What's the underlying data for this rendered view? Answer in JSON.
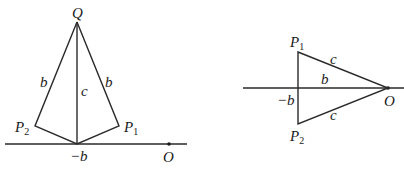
{
  "diagrams": [
    {
      "name": "left-figure",
      "labels": {
        "Q": "Q",
        "P1": "P",
        "P1_sub": "1",
        "P2": "P",
        "P2_sub": "2",
        "side_left": "b",
        "side_right": "b",
        "vertical": "c",
        "axis_point": "−b",
        "origin": "O"
      }
    },
    {
      "name": "right-figure",
      "labels": {
        "P1": "P",
        "P1_sub": "1",
        "P2": "P",
        "P2_sub": "2",
        "upper": "c",
        "lower": "c",
        "middle": "b",
        "axis_point": "−b",
        "origin": "O"
      }
    }
  ]
}
